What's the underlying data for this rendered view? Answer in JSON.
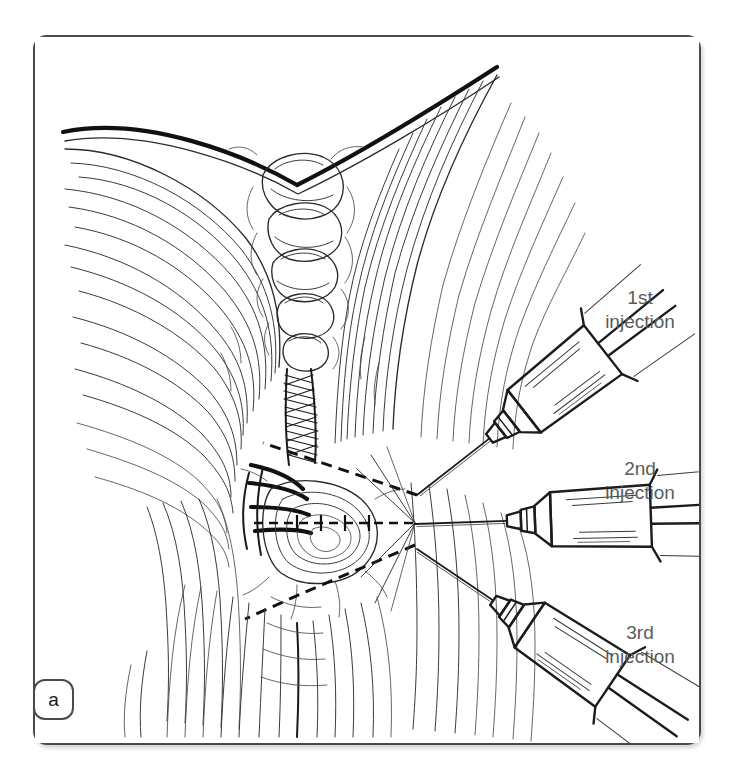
{
  "figure": {
    "panel_letter": "a",
    "caption_labels": [
      {
        "id": "first",
        "line1": "1st",
        "line2": "injection"
      },
      {
        "id": "second",
        "line1": "2nd",
        "line2": "injection"
      },
      {
        "id": "third",
        "line1": "3rd",
        "line2": "injection"
      }
    ]
  },
  "illustration": {
    "subject": "anatomical line drawing of neck / perineal midline with three syringes",
    "technique": "pen-and-ink hatching line art",
    "syringe_count": 3,
    "guide_lines": "dashed fan lines converging at a single injection point",
    "convergence_point": {
      "x": 415,
      "y": 492
    }
  },
  "colors": {
    "background": "#ffffff",
    "frame_border": "#4a4a4a",
    "ink": "#1a1a1a",
    "hatch": "#333333",
    "label_text": "#5b5b5b",
    "badge_text": "#1a1a1a"
  }
}
